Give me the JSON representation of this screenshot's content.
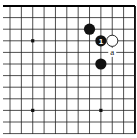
{
  "diagram": {
    "type": "go-board-fragment",
    "grid": {
      "columns": 12,
      "rows": 12,
      "origin_x": 10,
      "origin_y": 6,
      "spacing_x": 11.36,
      "spacing_y": 11.6,
      "edges": {
        "top": true,
        "right": true,
        "left": false,
        "bottom": false
      },
      "line_color": "#222222",
      "edge_color": "#000000"
    },
    "star_points": [
      {
        "col": 2,
        "row": 3
      },
      {
        "col": 2,
        "row": 9
      },
      {
        "col": 8,
        "row": 9
      }
    ],
    "stones": [
      {
        "color": "black",
        "col": 7,
        "row": 2,
        "label": ""
      },
      {
        "color": "black",
        "col": 8,
        "row": 3,
        "label": "1"
      },
      {
        "color": "white",
        "col": 9,
        "row": 3,
        "label": ""
      },
      {
        "color": "black",
        "col": 8,
        "row": 5,
        "label": ""
      }
    ],
    "markers": [
      {
        "col": 9,
        "row": 4,
        "label": "a"
      }
    ],
    "colors": {
      "black_stone": "#111111",
      "white_stone": "#ffffff",
      "stone_outline": "#111111",
      "background": "#ffffff"
    }
  }
}
